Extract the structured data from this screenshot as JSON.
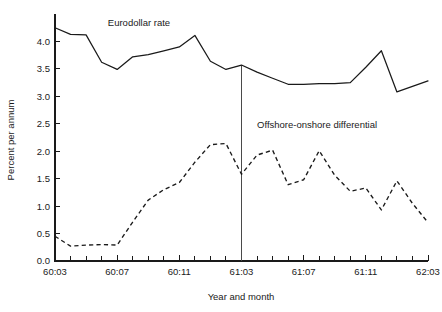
{
  "chart_data": {
    "type": "line",
    "title": "",
    "xlabel": "Year and month",
    "ylabel": "Percent per annum",
    "ylim": [
      0.0,
      4.5
    ],
    "yticks": [
      "0.0",
      "0.5",
      "1.0",
      "1.5",
      "2.0",
      "2.5",
      "3.0",
      "3.5",
      "4.0"
    ],
    "ytick_values": [
      0.0,
      0.5,
      1.0,
      1.5,
      2.0,
      2.5,
      3.0,
      3.5,
      4.0
    ],
    "xtick_labels": [
      "60:03",
      "60:07",
      "60:11",
      "61:03",
      "61:07",
      "61:11",
      "62:03"
    ],
    "xtick_label_indices": [
      0,
      4,
      8,
      12,
      16,
      20,
      24
    ],
    "x": [
      "60:03",
      "60:04",
      "60:05",
      "60:06",
      "60:07",
      "60:08",
      "60:09",
      "60:10",
      "60:11",
      "60:12",
      "61:01",
      "61:02",
      "61:03",
      "61:04",
      "61:05",
      "61:06",
      "61:07",
      "61:08",
      "61:09",
      "61:10",
      "61:11",
      "61:12",
      "62:01",
      "62:02",
      "62:03"
    ],
    "n_minor_ticks": 25,
    "grid": false,
    "legend_position": "inline-annotations",
    "annotations": [
      {
        "text": "Eurodollar rate",
        "x_index": 3.4,
        "y_value": 4.28
      },
      {
        "text": "Offshore-onshore differential",
        "x_index": 13.0,
        "y_value": 2.42
      }
    ],
    "marker_line": {
      "x_index": 12,
      "label": "61:03",
      "from_value": 0.0,
      "to_value": 3.57
    },
    "series": [
      {
        "name": "Eurodollar rate",
        "style": "solid",
        "values": [
          4.25,
          4.13,
          4.12,
          3.62,
          3.49,
          3.72,
          3.76,
          3.83,
          3.9,
          4.11,
          3.64,
          3.49,
          3.57,
          3.44,
          3.33,
          3.22,
          3.22,
          3.23,
          3.23,
          3.25,
          3.53,
          3.83,
          3.08,
          3.18,
          3.28
        ]
      },
      {
        "name": "Offshore-onshore differential",
        "style": "dashed",
        "values": [
          0.45,
          0.27,
          0.29,
          0.3,
          0.29,
          0.71,
          1.11,
          1.3,
          1.43,
          1.8,
          2.12,
          2.14,
          1.58,
          1.93,
          2.02,
          1.39,
          1.48,
          2.01,
          1.56,
          1.27,
          1.33,
          0.93,
          1.46,
          1.05,
          0.7
        ]
      }
    ]
  },
  "chart_meta": {
    "plot_left": 55,
    "plot_right": 428,
    "plot_bottom": 261,
    "plot_top": 14,
    "value_at_bottom": 0.0,
    "value_at_top": 4.5
  }
}
